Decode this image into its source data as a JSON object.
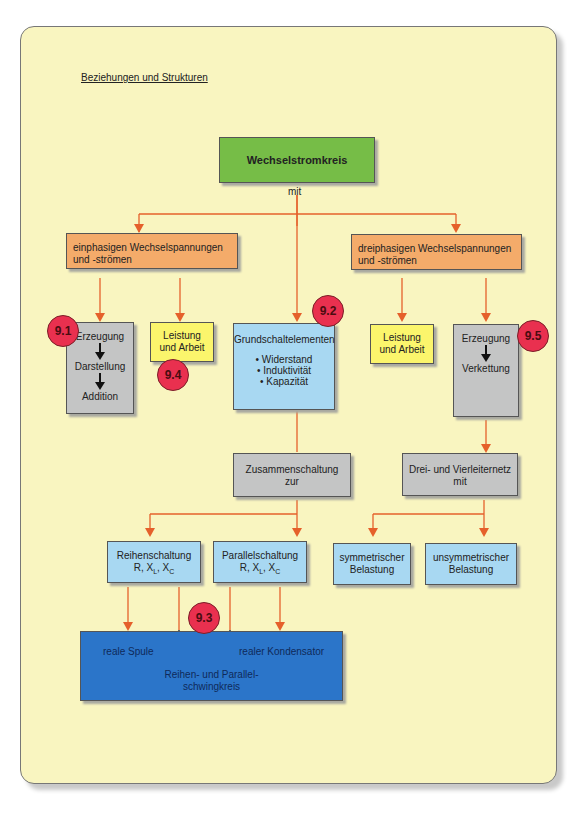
{
  "heading": "Beziehungen und Strukturen",
  "colors": {
    "background": "#f9f5c0",
    "line": "#e5602b",
    "root": "#76bd47",
    "branch": "#f4ab6a",
    "process": "#c4c5c5",
    "power": "#fbf56c",
    "element": "#a8d8f2",
    "result": "#2b75c9",
    "badge": "#e9304f"
  },
  "root": {
    "label": "Wechselstromkreis",
    "connector": "mit"
  },
  "branches": {
    "single": {
      "label": "einphasigen Wechselspannungen und -strömen"
    },
    "three": {
      "label": "dreiphasigen Wechselspannungen und -strömen"
    }
  },
  "nodes": {
    "single_process": {
      "steps": [
        "Erzeugung",
        "Darstellung",
        "Addition"
      ],
      "badge": "9.1"
    },
    "single_power": {
      "line1": "Leistung",
      "line2": "und Arbeit",
      "badge": "9.4"
    },
    "basic_elements": {
      "title": "Grundschaltelementen",
      "items": [
        "• Widerstand",
        "• Induktivität",
        "• Kapazität"
      ],
      "badge": "9.2"
    },
    "three_power": {
      "line1": "Leistung",
      "line2": "und Arbeit"
    },
    "three_process": {
      "steps": [
        "Erzeugung",
        "Verkettung"
      ],
      "badge": "9.5"
    },
    "combination": {
      "line1": "Zusammenschaltung",
      "line2": "zur"
    },
    "network": {
      "line1": "Drei- und Vierleiternetz",
      "line2": "mit"
    },
    "series": {
      "line1": "Reihenschaltung",
      "r": "R, X",
      "l": "L",
      "sep": ", X",
      "c": "C"
    },
    "parallel": {
      "line1": "Parallelschaltung",
      "r": "R, X",
      "l": "L",
      "sep": ", X",
      "c": "C"
    },
    "symmetric": {
      "line1": "symmetrischer",
      "line2": "Belastung"
    },
    "asymmetric": {
      "line1": "unsymmetrischer",
      "line2": "Belastung"
    },
    "result": {
      "left": "reale Spule",
      "right": "realer Kondensator",
      "center1": "Reihen- und Parallel-",
      "center2": "schwingkreis",
      "badge": "9.3"
    }
  }
}
